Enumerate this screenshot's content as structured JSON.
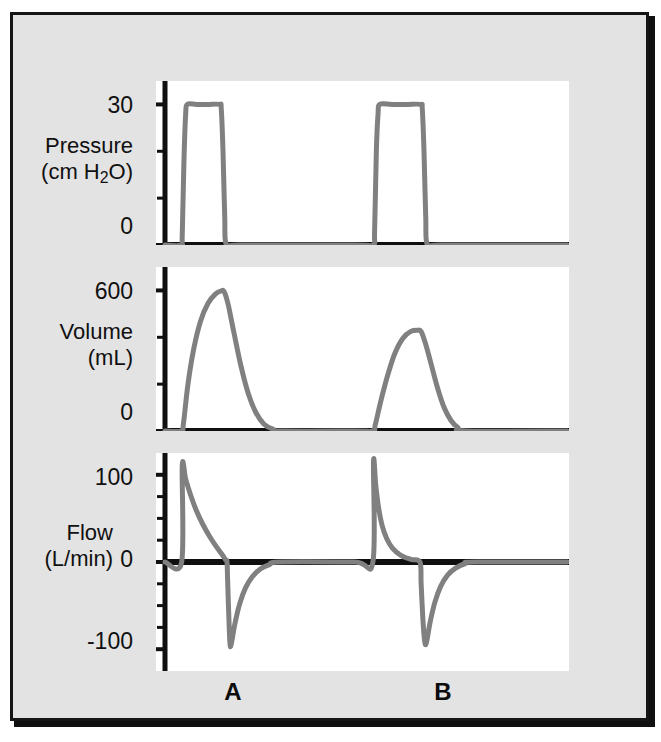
{
  "figure": {
    "background_color": "#e3e3e3",
    "panel_color": "#ffffff",
    "trace_color": "#808080",
    "axis_color": "#101010"
  },
  "panels": [
    {
      "id": "pressure",
      "axis_name": "Pressure",
      "axis_unit": "(cm H2O)",
      "axis_unit_html": "(cm H<sub>2</sub>O)",
      "tick_labels": [
        "30",
        "0"
      ],
      "ticks": [
        0,
        10,
        20,
        30
      ],
      "ylim": [
        0,
        35
      ]
    },
    {
      "id": "volume",
      "axis_name": "Volume",
      "axis_unit": "(mL)",
      "tick_labels": [
        "600",
        "0"
      ],
      "ticks": [
        0,
        200,
        400,
        600
      ],
      "ylim": [
        0,
        700
      ]
    },
    {
      "id": "flow",
      "axis_name": "Flow",
      "axis_unit": "(L/min)",
      "tick_labels": [
        "100",
        "0",
        "-100"
      ],
      "ticks": [
        -100,
        -75,
        -50,
        -25,
        0,
        25,
        50,
        75,
        100
      ],
      "ylim": [
        -125,
        125
      ]
    }
  ],
  "breath_labels": [
    {
      "label": "A",
      "x_center": 222
    },
    {
      "label": "B",
      "x_center": 432
    }
  ],
  "chart_data": [
    {
      "type": "line",
      "title": "Pressure",
      "ylabel": "Pressure (cm H2O)",
      "xlabel": "",
      "ylim": [
        0,
        35
      ],
      "yticks": [
        0,
        10,
        20,
        30
      ],
      "ytick_labels": [
        "0",
        "",
        "",
        "30"
      ],
      "grid": false,
      "legend": false,
      "series": [
        {
          "name": "Airway pressure",
          "color": "#808080",
          "points": [
            [
              0.0,
              0
            ],
            [
              0.28,
              0
            ],
            [
              0.3,
              2
            ],
            [
              0.33,
              18
            ],
            [
              0.36,
              28
            ],
            [
              0.39,
              30
            ],
            [
              0.55,
              30
            ],
            [
              0.75,
              30
            ],
            [
              0.95,
              30
            ],
            [
              0.98,
              29
            ],
            [
              1.01,
              20
            ],
            [
              1.04,
              6
            ],
            [
              1.07,
              0
            ],
            [
              1.3,
              0
            ],
            [
              3.3,
              0
            ],
            [
              3.62,
              0
            ],
            [
              3.65,
              3
            ],
            [
              3.68,
              20
            ],
            [
              3.71,
              28
            ],
            [
              3.74,
              30
            ],
            [
              3.95,
              30
            ],
            [
              4.2,
              30
            ],
            [
              4.45,
              30
            ],
            [
              4.48,
              29
            ],
            [
              4.51,
              20
            ],
            [
              4.54,
              6
            ],
            [
              4.57,
              0
            ],
            [
              4.8,
              0
            ],
            [
              7.0,
              0
            ]
          ]
        }
      ],
      "annotation": "Identical square pressure waveforms of 30 cm H2O for breath A and breath B (pressure control)."
    },
    {
      "type": "line",
      "title": "Volume",
      "ylabel": "Volume (mL)",
      "xlabel": "",
      "ylim": [
        0,
        700
      ],
      "yticks": [
        0,
        200,
        400,
        600
      ],
      "ytick_labels": [
        "0",
        "",
        "",
        "600"
      ],
      "grid": false,
      "legend": false,
      "series": [
        {
          "name": "Tidal volume",
          "color": "#808080",
          "points": [
            [
              0.0,
              0
            ],
            [
              0.28,
              0
            ],
            [
              0.32,
              30
            ],
            [
              0.4,
              200
            ],
            [
              0.5,
              350
            ],
            [
              0.62,
              470
            ],
            [
              0.75,
              545
            ],
            [
              0.88,
              585
            ],
            [
              0.98,
              598
            ],
            [
              1.03,
              595
            ],
            [
              1.1,
              540
            ],
            [
              1.2,
              420
            ],
            [
              1.32,
              280
            ],
            [
              1.45,
              160
            ],
            [
              1.58,
              80
            ],
            [
              1.72,
              30
            ],
            [
              1.88,
              8
            ],
            [
              2.05,
              0
            ],
            [
              3.3,
              0
            ],
            [
              3.62,
              0
            ],
            [
              3.66,
              25
            ],
            [
              3.76,
              130
            ],
            [
              3.88,
              240
            ],
            [
              4.0,
              330
            ],
            [
              4.14,
              395
            ],
            [
              4.28,
              425
            ],
            [
              4.4,
              430
            ],
            [
              4.46,
              425
            ],
            [
              4.54,
              370
            ],
            [
              4.64,
              280
            ],
            [
              4.75,
              180
            ],
            [
              4.86,
              100
            ],
            [
              4.98,
              45
            ],
            [
              5.1,
              15
            ],
            [
              5.25,
              0
            ],
            [
              7.0,
              0
            ]
          ]
        }
      ],
      "annotation": "Breath A delivers about 600 mL; breath B delivers only about 430 mL at the same pressure."
    },
    {
      "type": "line",
      "title": "Flow",
      "ylabel": "Flow (L/min)",
      "xlabel": "",
      "ylim": [
        -125,
        125
      ],
      "yticks": [
        -100,
        -75,
        -50,
        -25,
        0,
        25,
        50,
        75,
        100
      ],
      "ytick_labels": [
        "-100",
        "",
        "",
        "",
        "0",
        "",
        "",
        "",
        "100"
      ],
      "grid": false,
      "legend": false,
      "zero_line": true,
      "series": [
        {
          "name": "Inspiratory / expiratory flow",
          "color": "#808080",
          "points": [
            [
              0.0,
              0
            ],
            [
              0.29,
              0
            ],
            [
              0.3,
              110
            ],
            [
              0.36,
              95
            ],
            [
              0.44,
              78
            ],
            [
              0.54,
              60
            ],
            [
              0.66,
              43
            ],
            [
              0.78,
              29
            ],
            [
              0.9,
              17
            ],
            [
              1.0,
              8
            ],
            [
              1.06,
              2
            ],
            [
              1.08,
              0
            ],
            [
              1.09,
              -20
            ],
            [
              1.11,
              -60
            ],
            [
              1.13,
              -92
            ],
            [
              1.15,
              -95
            ],
            [
              1.22,
              -70
            ],
            [
              1.3,
              -48
            ],
            [
              1.4,
              -30
            ],
            [
              1.52,
              -17
            ],
            [
              1.66,
              -8
            ],
            [
              1.82,
              -3
            ],
            [
              2.0,
              0
            ],
            [
              3.3,
              0
            ],
            [
              3.62,
              0
            ],
            [
              3.63,
              115
            ],
            [
              3.67,
              88
            ],
            [
              3.72,
              62
            ],
            [
              3.78,
              42
            ],
            [
              3.86,
              27
            ],
            [
              3.96,
              16
            ],
            [
              4.1,
              8
            ],
            [
              4.28,
              3
            ],
            [
              4.44,
              0
            ],
            [
              4.46,
              -25
            ],
            [
              4.49,
              -65
            ],
            [
              4.52,
              -90
            ],
            [
              4.55,
              -93
            ],
            [
              4.62,
              -68
            ],
            [
              4.7,
              -46
            ],
            [
              4.8,
              -28
            ],
            [
              4.92,
              -15
            ],
            [
              5.06,
              -7
            ],
            [
              5.22,
              -2
            ],
            [
              5.4,
              0
            ],
            [
              7.0,
              0
            ]
          ]
        }
      ],
      "annotation": "Breath A shows a slow decelerating inspiratory flow; breath B shows a brief high-peak flow that falls rapidly to zero."
    }
  ]
}
